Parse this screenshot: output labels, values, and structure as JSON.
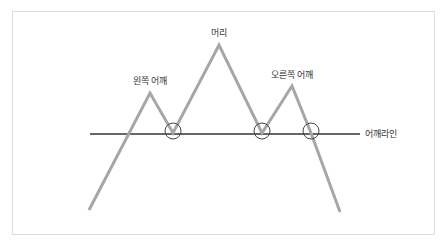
{
  "diagram": {
    "title": "",
    "labels": {
      "left_shoulder": "왼쪽 어깨",
      "head": "머리",
      "right_shoulder": "오른쪽 어깨",
      "neckline": "어깨라인"
    },
    "colors": {
      "price_line": "#a6a6a6",
      "neckline": "#333333",
      "circle": "#444444",
      "frame": "#dcdcdc"
    },
    "price_path": [
      [
        89,
        210
      ],
      [
        150,
        93
      ],
      [
        173,
        133
      ],
      [
        219,
        45
      ],
      [
        262,
        133
      ],
      [
        292,
        86
      ],
      [
        311,
        133
      ],
      [
        340,
        212
      ]
    ],
    "neckline": {
      "x1": 90,
      "x2": 360,
      "y": 134
    },
    "circles": [
      {
        "cx": 173,
        "cy": 131,
        "r": 8
      },
      {
        "cx": 262,
        "cy": 131,
        "r": 8
      },
      {
        "cx": 311,
        "cy": 131,
        "r": 8
      }
    ]
  }
}
